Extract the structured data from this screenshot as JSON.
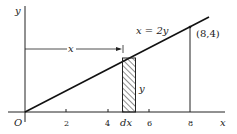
{
  "figure": {
    "equation_label": "x = 2y",
    "point_label": "(8,4)",
    "origin_label": "O",
    "x_axis_label": "x",
    "y_axis_label": "y",
    "x_ticks": [
      "2",
      "4",
      "6",
      "8"
    ],
    "strip_width_label": "dx",
    "strip_height_label": "y",
    "distance_label": "x"
  },
  "colors": {
    "ink": "#222222",
    "background": "#ffffff"
  }
}
